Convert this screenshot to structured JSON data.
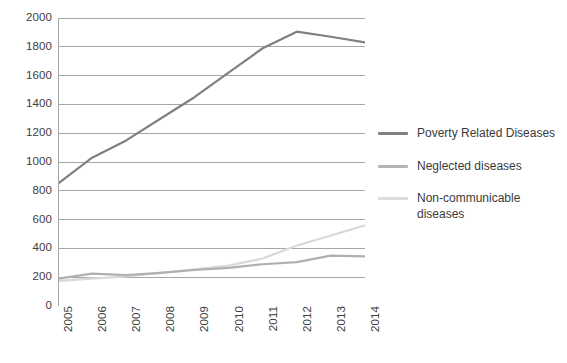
{
  "chart_data": {
    "type": "line",
    "title": "",
    "subtitle": "",
    "xlabel": "",
    "ylabel": "",
    "x": [
      "2005",
      "2006",
      "2007",
      "2008",
      "2009",
      "2010",
      "2011",
      "2012",
      "2013",
      "2014"
    ],
    "categories": [
      "2005",
      "2006",
      "2007",
      "2008",
      "2009",
      "2010",
      "2011",
      "2012",
      "2013",
      "2014"
    ],
    "xlim": [
      0,
      9
    ],
    "ylim": [
      0,
      2000
    ],
    "y_ticks": [
      0,
      200,
      400,
      600,
      800,
      1000,
      1200,
      1400,
      1600,
      1800,
      2000
    ],
    "grid": true,
    "grid_axis": "y",
    "legend_position": "right",
    "series": [
      {
        "name": "Poverty Related Diseases",
        "color": "#808080",
        "values": [
          850,
          1030,
          1150,
          1300,
          1450,
          1620,
          1790,
          1905,
          1870,
          1830
        ]
      },
      {
        "name": "Neglected diseases",
        "color": "#b0b0b0",
        "values": [
          190,
          225,
          215,
          230,
          250,
          265,
          290,
          305,
          350,
          345
        ]
      },
      {
        "name": "Non-communicable diseases",
        "color": "#d9d9d9",
        "values": [
          175,
          190,
          205,
          230,
          255,
          280,
          330,
          420,
          490,
          560
        ]
      }
    ]
  },
  "axes": {
    "y_tick_labels": [
      "2000",
      "1800",
      "1600",
      "1400",
      "1200",
      "1000",
      "800",
      "600",
      "400",
      "200",
      "0"
    ],
    "x_tick_labels": [
      "2005",
      "2006",
      "2007",
      "2008",
      "2009",
      "2010",
      "2011",
      "2012",
      "2013",
      "2014"
    ]
  },
  "legend": {
    "items": [
      {
        "label": "Poverty Related Diseases",
        "color": "#808080"
      },
      {
        "label": "Neglected diseases",
        "color": "#b4b4b4"
      },
      {
        "label": "Non-communicable diseases",
        "color": "#dcdcdc"
      }
    ]
  },
  "colors": {
    "grid": "#a6a6a6",
    "axis": "#a6a6a6",
    "text": "#3d3d3d",
    "background": "#ffffff"
  }
}
